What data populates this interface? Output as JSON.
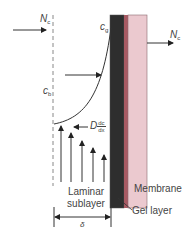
{
  "diagram": {
    "labels": {
      "flux_in": "N",
      "flux_in_sub": "c",
      "flux_out": "N",
      "flux_out_sub": "c",
      "bulk_conc": "c",
      "bulk_conc_sub": "b",
      "gel_conc": "c",
      "gel_conc_sub": "g",
      "back_diffusion_D": "D",
      "back_diffusion_num": "dc",
      "back_diffusion_den": "dx",
      "laminar_line1": "Laminar",
      "laminar_line2": "sublayer",
      "delta": "δ",
      "membrane": "Membrane",
      "gel_layer": "Gel layer"
    },
    "colors": {
      "gel_layer": "#2e2e2e",
      "gel_edge": "#a85a63",
      "membrane": "#ebc9cf",
      "line": "#333333",
      "dashed": "#888888"
    }
  }
}
